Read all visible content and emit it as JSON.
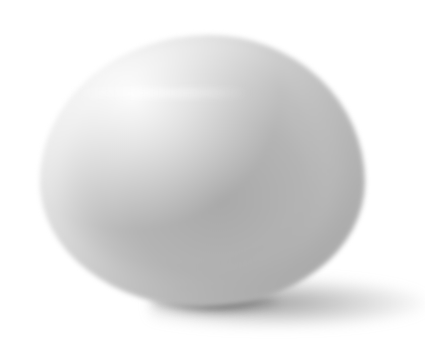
{
  "image": {
    "subject": "egg",
    "description": "Grayscale photograph of a single egg on a white background with a soft shadow to the lower right",
    "colors": {
      "background": "#ffffff",
      "egg_mid": "#b4b4b4",
      "egg_highlight": "#f0f0f0",
      "shadow": "#5a5a5a"
    }
  }
}
